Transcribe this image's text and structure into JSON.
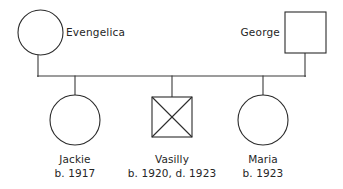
{
  "diagram": {
    "type": "pedigree-chart",
    "title": "",
    "colors": {
      "background": "#ffffff",
      "stroke": "#2b2b2b",
      "line": "#3a3a3a",
      "text": "#262626"
    },
    "parents": [
      {
        "id": "evengelica",
        "name": "Evengelica",
        "sex": "female",
        "symbol": "circle",
        "status": "living",
        "label_side": "right",
        "cx": 40.5,
        "cy": 32.5,
        "r": 22.5,
        "label_x": 66,
        "label_y": 36
      },
      {
        "id": "george",
        "name": "George",
        "sex": "male",
        "symbol": "square",
        "status": "living",
        "label_side": "left",
        "x": 285,
        "y": 12,
        "size": 41,
        "label_x": 280,
        "label_y": 36
      }
    ],
    "children": [
      {
        "id": "jackie",
        "name": "Jackie",
        "dates": "b. 1917",
        "sex": "female",
        "symbol": "circle",
        "status": "living",
        "cx": 75,
        "cy": 120,
        "r": 25,
        "label_x": 75,
        "label_line1_y": 163,
        "label_line2_y": 177
      },
      {
        "id": "vasilly",
        "name": "Vasilly",
        "dates": "b. 1920, d. 1923",
        "sex": "male",
        "symbol": "square",
        "status": "deceased",
        "x": 152,
        "y": 97,
        "size": 40,
        "label_x": 172,
        "label_line1_y": 163,
        "label_line2_y": 177
      },
      {
        "id": "maria",
        "name": "Maria",
        "dates": "b. 1923",
        "sex": "female",
        "symbol": "circle",
        "status": "living",
        "cx": 263,
        "cy": 120,
        "r": 25,
        "label_x": 263,
        "label_line1_y": 163,
        "label_line2_y": 177
      }
    ],
    "connections": {
      "sibship_line_y": 76,
      "sibship_line_x1": 38,
      "sibship_line_x2": 305,
      "mother_drop": {
        "x": 38,
        "y1": 55,
        "y2": 76
      },
      "father_drop": {
        "x": 305,
        "y1": 53,
        "y2": 76
      },
      "child_drops": [
        {
          "x": 75,
          "y1": 76,
          "y2": 95
        },
        {
          "x": 172,
          "y1": 76,
          "y2": 97
        },
        {
          "x": 263,
          "y1": 76,
          "y2": 95
        }
      ]
    },
    "legend_meaning": {
      "circle": "female",
      "square": "male",
      "crossed-symbol": "deceased"
    }
  }
}
